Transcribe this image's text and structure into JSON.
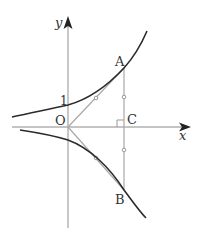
{
  "diagram": {
    "type": "coordinate-geometry",
    "axes": {
      "x_label": "x",
      "y_label": "y",
      "origin_label": "O",
      "y_intercept_label": "1"
    },
    "points": {
      "A": "A",
      "B": "B",
      "C": "C"
    },
    "elements": {
      "upper_curve": "curve through (0,1), increasing, passing through A",
      "lower_curve": "reflection of upper curve across x-axis, passing through B",
      "segment_OA": "O to A with tick mark",
      "segment_OB": "O to B with tick mark",
      "segment_AB": "vertical segment through C with tick marks on AC and CB",
      "right_angle_marker": "at C"
    },
    "colors": {
      "curve": "#2b2b2b",
      "axis": "#b0b0b0",
      "segment": "#a8a8a8",
      "label": "#333333"
    }
  }
}
